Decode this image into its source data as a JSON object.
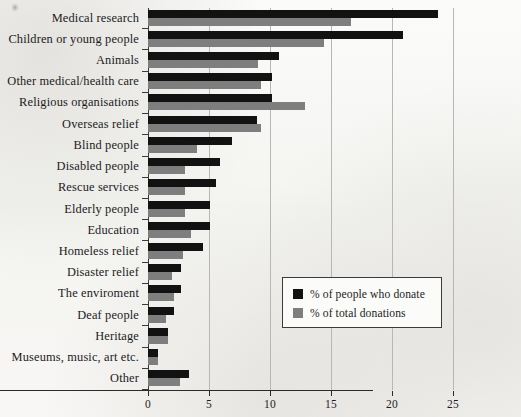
{
  "chart_data": {
    "type": "bar",
    "orientation": "horizontal",
    "title": "",
    "xlabel": "",
    "ylabel": "",
    "xlim": [
      0,
      25
    ],
    "xticks": [
      0,
      5,
      10,
      15,
      20,
      25
    ],
    "xtick_labels": [
      "0",
      "5",
      "10",
      "15",
      "20",
      "25"
    ],
    "grid": "vertical",
    "legend_position": "lower-right-inside",
    "categories": [
      "Medical research",
      "Children or young people",
      "Animals",
      "Other medical/health care",
      "Religious organisations",
      "Overseas relief",
      "Blind people",
      "Disabled people",
      "Rescue services",
      "Elderly people",
      "Education",
      "Homeless relief",
      "Disaster relief",
      "The enviroment",
      "Deaf people",
      "Heritage",
      "Museums, music, art etc.",
      "Other"
    ],
    "series": [
      {
        "name": "% of people who donate",
        "color": "#121212",
        "values": [
          23.8,
          20.9,
          10.7,
          10.2,
          10.2,
          8.9,
          6.9,
          5.9,
          5.6,
          5.1,
          5.1,
          4.5,
          2.7,
          2.7,
          2.1,
          1.6,
          0.8,
          3.4
        ]
      },
      {
        "name": "% of total donations",
        "color": "#7e7e7e",
        "values": [
          16.6,
          14.4,
          9.0,
          9.3,
          12.9,
          9.3,
          4.0,
          3.0,
          3.0,
          3.0,
          3.5,
          2.9,
          2.0,
          2.1,
          1.5,
          1.6,
          0.8,
          2.6
        ]
      }
    ]
  },
  "legend": {
    "entries": [
      {
        "label": "% of people who donate",
        "swatch": "#121212"
      },
      {
        "label": "% of total donations",
        "swatch": "#7e7e7e"
      }
    ]
  }
}
